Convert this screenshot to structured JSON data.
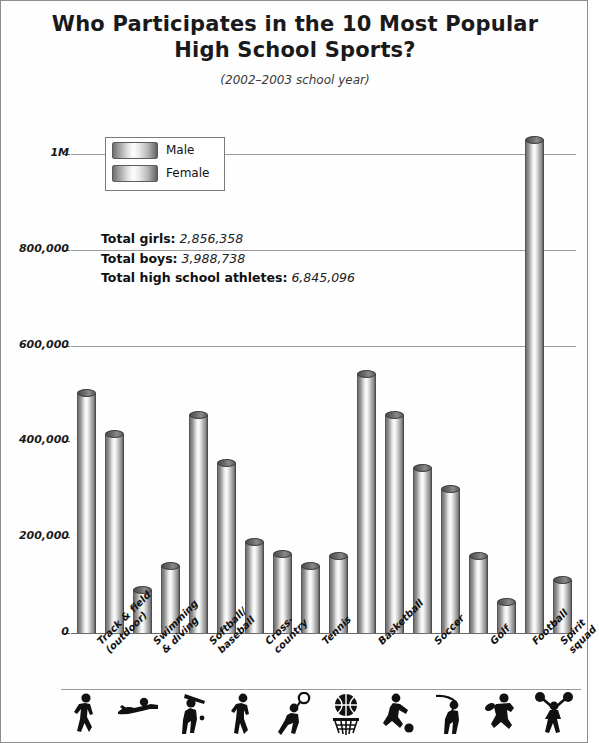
{
  "chart_data": {
    "type": "bar",
    "title": "Who Participates in the 10 Most Popular High School Sports?",
    "title_line1": "Who Participates in the 10 Most Popular",
    "title_line2": "High School Sports?",
    "subtitle": "(2002–2003 school year)",
    "xlabel": "",
    "ylabel": "Number of kids ages 11–17 who participate",
    "ylim": [
      0,
      1100000
    ],
    "grid": true,
    "legend_position": "upper-left",
    "ytick_values": [
      0,
      200000,
      400000,
      600000,
      800000,
      1000000
    ],
    "ytick_labels": [
      "0",
      "200,000",
      "400,000",
      "600,000",
      "800,000",
      "1M"
    ],
    "categories": [
      "Track & field\n(outdoor)",
      "Swimming\n& diving",
      "Softball/\nbaseball",
      "Cross-\ncountry",
      "Tennis",
      "Basketball",
      "Soccer",
      "Golf",
      "Football",
      "Spirit\nsquad"
    ],
    "series": [
      {
        "name": "Male",
        "values": [
          500000,
          90000,
          455000,
          190000,
          140000,
          540000,
          345000,
          160000,
          1030000,
          null
        ]
      },
      {
        "name": "Female",
        "values": [
          415000,
          140000,
          355000,
          165000,
          160000,
          455000,
          300000,
          65000,
          null,
          110000
        ]
      }
    ],
    "annotations": [
      {
        "label": "Total girls:",
        "value": "2,856,358"
      },
      {
        "label": "Total boys:",
        "value": "3,988,738"
      },
      {
        "label": "Total high school athletes:",
        "value": "6,845,096"
      }
    ],
    "pictograms": [
      "runner-icon",
      "swimmer-icon",
      "batter-icon",
      "cross-country-runner-icon",
      "tennis-player-icon",
      "basketball-hoop-icon",
      "soccer-player-icon",
      "golfer-icon",
      "football-player-icon",
      "cheerleader-icon"
    ],
    "colors": {
      "bar_light": "#fdfdfd",
      "bar_dark": "#5e5e5e",
      "cap": "#5c5c5c",
      "gridline": "#9a9a9a",
      "text": "#111111",
      "background": "#fefefe",
      "border": "#8d8d8d"
    }
  }
}
